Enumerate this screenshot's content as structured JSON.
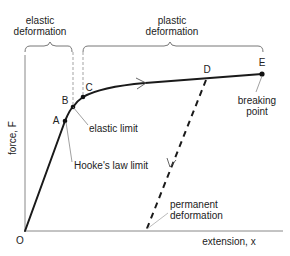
{
  "regions": {
    "elastic": {
      "line1": "elastic",
      "line2": "deformation"
    },
    "plastic": {
      "line1": "plastic",
      "line2": "deformation"
    }
  },
  "axes": {
    "y_label": "force, F",
    "x_label": "extension, x",
    "origin": "O"
  },
  "points": {
    "A": "A",
    "B": "B",
    "C": "C",
    "D": "D",
    "E": "E"
  },
  "annotations": {
    "elastic_limit": "elastic limit",
    "hookes_law_limit": "Hooke's law limit",
    "breaking_point_1": "breaking",
    "breaking_point_2": "point",
    "permanent_1": "permanent",
    "permanent_2": "deformation"
  },
  "colors": {
    "curve": "#1a1a1a",
    "axis": "#888888",
    "guide": "#999999",
    "text": "#222222"
  }
}
